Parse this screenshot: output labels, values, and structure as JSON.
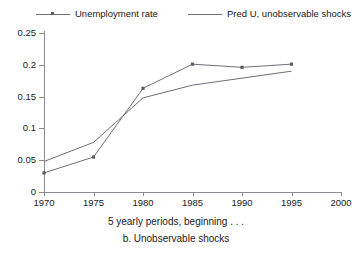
{
  "chart_data": {
    "type": "line",
    "title": "",
    "xlabel": "5 yearly periods, beginning . . .",
    "sublabel": "b. Unobservable shocks",
    "x": [
      1970,
      1975,
      1980,
      1985,
      1990,
      1995
    ],
    "xlim": [
      1970,
      2000
    ],
    "ylim": [
      0,
      0.25
    ],
    "xticks": [
      1970,
      1975,
      1980,
      1985,
      1990,
      1995,
      2000
    ],
    "xtick_labels": [
      "1970",
      "1975",
      "1980",
      "1985",
      "1990",
      "1995",
      "2000"
    ],
    "yticks": [
      0,
      0.05,
      0.1,
      0.15,
      0.2,
      0.25
    ],
    "ytick_labels": [
      "0",
      "0.05",
      "0.1",
      "0.15",
      "0.2",
      "0.25"
    ],
    "grid": false,
    "legend_position": "top",
    "series": [
      {
        "name": "Unemployment rate",
        "marker": "point",
        "color": "#6e6e78",
        "values": [
          0.03,
          0.055,
          0.163,
          0.201,
          0.196,
          0.201
        ]
      },
      {
        "name": "Pred U, unobservable shocks",
        "marker": "none",
        "color": "#6e6e78",
        "values": [
          0.048,
          0.078,
          0.148,
          0.168,
          0.179,
          0.19
        ]
      }
    ]
  },
  "legend": {
    "entries": [
      {
        "label": "Unemployment rate"
      },
      {
        "label": "Pred U, unobservable shocks"
      }
    ]
  },
  "axes": {
    "x_caption": "5 yearly periods, beginning . . .",
    "sub_caption": "b. Unobservable shocks"
  }
}
